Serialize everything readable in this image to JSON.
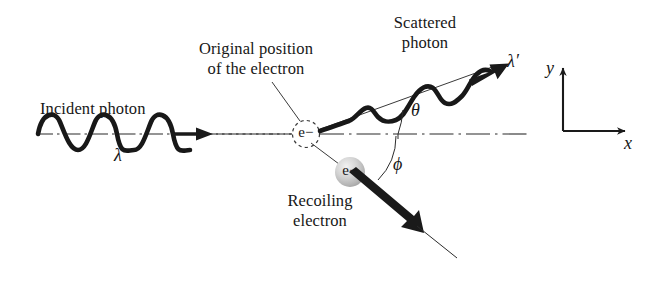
{
  "figure": {
    "background_color": "#ffffff",
    "ink_color": "#1a1a1a"
  },
  "labels": {
    "incident_photon": "Incident photon",
    "incident_wavelength": "λ",
    "original_position_line1": "Original position",
    "original_position_line2": "of the electron",
    "scattered_line1": "Scattered",
    "scattered_line2": "photon",
    "scattered_wavelength": "λ′",
    "theta_angle": "θ",
    "phi_angle": "ϕ",
    "recoiling_line1": "Recoiling",
    "recoiling_line2": "electron",
    "electron_at_origin": "e−",
    "electron_recoiling": "e−",
    "axis_y": "y",
    "axis_x": "x"
  },
  "geometry": {
    "origin_electron": {
      "cx": 306,
      "cy": 134,
      "r": 14
    },
    "recoil_electron": {
      "cx": 350,
      "cy": 172,
      "r": 15
    },
    "axis_corner": {
      "x": 563,
      "y": 131
    },
    "axis_y_tip": {
      "x": 563,
      "y": 62
    },
    "axis_x_tip": {
      "x": 632,
      "y": 131
    },
    "incident_axis_y": 134,
    "scattered_angle_deg": 20,
    "recoil_angle_deg": 40
  }
}
